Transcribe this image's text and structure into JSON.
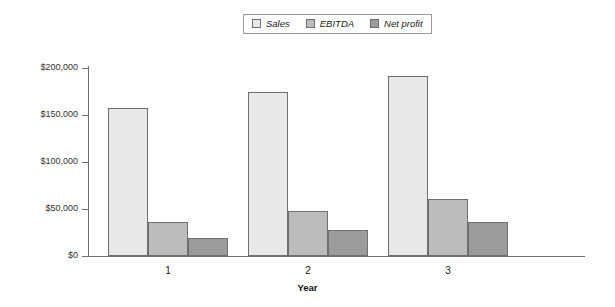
{
  "chart_data": {
    "type": "bar",
    "title": "",
    "xlabel": "Year",
    "ylabel": "",
    "categories": [
      "1",
      "2",
      "3"
    ],
    "series": [
      {
        "name": "Sales",
        "values": [
          157000,
          174000,
          192000
        ],
        "color": "#e8e8e8"
      },
      {
        "name": "EBITDA",
        "values": [
          36000,
          48000,
          61000
        ],
        "color": "#bcbcbc"
      },
      {
        "name": "Net profit",
        "values": [
          19000,
          28000,
          36000
        ],
        "color": "#9b9b9b"
      }
    ],
    "ylim": [
      0,
      200000
    ],
    "ytick_values": [
      0,
      50000,
      100000,
      150000,
      200000
    ],
    "ytick_labels": [
      "$0",
      "$50,000",
      "$100,000",
      "$150,000",
      "$200,000"
    ],
    "grid": false,
    "legend_position": "top-center",
    "border_color": "#6f6f6f",
    "axis_color": "#707070"
  },
  "legend": {
    "entries": [
      {
        "label": "Sales"
      },
      {
        "label": "EBITDA"
      },
      {
        "label": "Net profit"
      }
    ]
  },
  "axes": {
    "x_title": "Year"
  }
}
